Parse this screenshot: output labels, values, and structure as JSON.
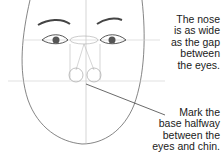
{
  "annotations": {
    "nose_width": [
      "The nose",
      "is as wide",
      "as the gap",
      "between",
      "the eyes."
    ],
    "nose_base": [
      "Mark the",
      "base halfway",
      "between the",
      "eyes and chin."
    ]
  },
  "colors": {
    "line": "#555555",
    "guide": "#bbbbbb",
    "text": "#1a1a1a"
  }
}
